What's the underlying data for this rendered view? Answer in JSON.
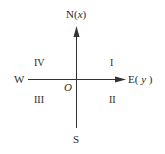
{
  "diagram": {
    "type": "surveying-coordinate-system",
    "axes": {
      "north": {
        "label": "N",
        "var": "x"
      },
      "east": {
        "label": "E",
        "var": "y"
      },
      "west": {
        "label": "W"
      },
      "south": {
        "label": "S"
      },
      "origin": {
        "label": "O"
      }
    },
    "quadrants": {
      "q1": "I",
      "q2": "II",
      "q3": "III",
      "q4": "IV"
    },
    "colors": {
      "line": "#333333",
      "text": "#2a2a2a",
      "background": "#ffffff"
    }
  }
}
